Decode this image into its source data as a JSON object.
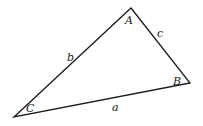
{
  "diagram": {
    "type": "triangle",
    "vertices": {
      "A": {
        "label": "A"
      },
      "B": {
        "label": "B"
      },
      "C": {
        "label": "C"
      }
    },
    "sides": {
      "a": {
        "label": "a",
        "between": [
          "B",
          "C"
        ]
      },
      "b": {
        "label": "b",
        "between": [
          "A",
          "C"
        ]
      },
      "c": {
        "label": "c",
        "between": [
          "A",
          "B"
        ]
      }
    },
    "stroke_color": "#1a1a1a",
    "background": "#ffffff"
  }
}
